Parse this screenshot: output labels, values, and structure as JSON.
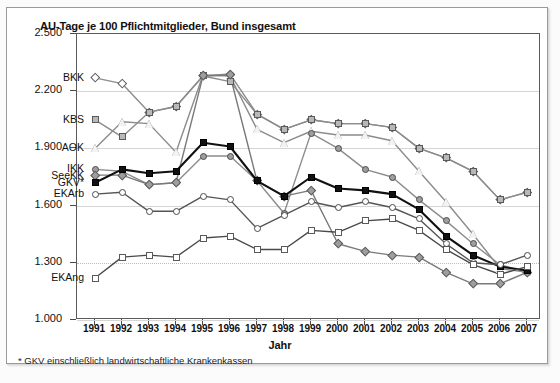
{
  "chart_data": {
    "type": "line",
    "title": "AU-Tage je 100 Pflichtmitglieder, Bund insgesamt",
    "xlabel": "Jahr",
    "ylabel": "",
    "footnote": "* GKV einschließlich landwirtschaftliche Krankenkassen",
    "grid": true,
    "legend_position": "inline-left",
    "ylim": [
      1000,
      2500
    ],
    "ytick_labels": [
      "2.500",
      "2.200",
      "1.900",
      "1.600",
      "1.300",
      "1.000"
    ],
    "ytick_values": [
      2500,
      2200,
      1900,
      1600,
      1300,
      1000
    ],
    "categories": [
      "1991",
      "1992",
      "1993",
      "1994",
      "1995",
      "1996",
      "1997",
      "1998",
      "1999",
      "2000",
      "2001",
      "2002",
      "2003",
      "2004",
      "2005",
      "2006",
      "2007"
    ],
    "series": [
      {
        "name": "BKK",
        "marker": "diamond-open",
        "color": "#8c8c8c",
        "fill": "#ffffff",
        "values": [
          2270,
          2240,
          2090,
          2120,
          2280,
          2290,
          2080,
          2000,
          2050,
          2030,
          2030,
          2010,
          1900,
          1850,
          1780,
          1630,
          1670
        ]
      },
      {
        "name": "KBS",
        "marker": "triangle-open",
        "color": "#8c8c8c",
        "fill": "#f2f2f2",
        "values": [
          1900,
          2040,
          2030,
          1880,
          2285,
          2280,
          2000,
          1930,
          1990,
          1970,
          1970,
          1940,
          1780,
          1620,
          1450,
          1270,
          1250
        ]
      },
      {
        "name": "AOK",
        "marker": "square-gray",
        "color": "#8c8c8c",
        "fill": "#b8b8b8",
        "values": [
          2050,
          1960,
          2090,
          2120,
          2280,
          2250,
          2080,
          2000,
          2050,
          2030,
          2030,
          2010,
          1900,
          1850,
          1780,
          1630,
          1670
        ]
      },
      {
        "name": "IKK",
        "marker": "circle-gray",
        "color": "#8c8c8c",
        "fill": "#9e9e9e",
        "values": [
          1790,
          1780,
          1710,
          1720,
          1860,
          1860,
          1730,
          1560,
          1980,
          1900,
          1790,
          1750,
          1630,
          1520,
          1400,
          1290,
          1250
        ]
      },
      {
        "name": "SeeKK",
        "marker": "diamond-gray",
        "color": "#7a7a7a",
        "fill": "#9e9e9e",
        "values": [
          1760,
          1760,
          1710,
          1720,
          2280,
          2285,
          1730,
          1650,
          1680,
          1400,
          1360,
          1340,
          1330,
          1250,
          1190,
          1190,
          1250
        ]
      },
      {
        "name": "GKV*",
        "marker": "square-black",
        "color": "#111111",
        "fill": "#111111",
        "values": [
          1720,
          1790,
          1770,
          1780,
          1930,
          1910,
          1730,
          1650,
          1750,
          1690,
          1680,
          1660,
          1580,
          1440,
          1340,
          1280,
          1260
        ]
      },
      {
        "name": "EKArb",
        "marker": "circle-open",
        "color": "#555555",
        "fill": "#ffffff",
        "values": [
          1660,
          1670,
          1570,
          1570,
          1650,
          1630,
          1480,
          1550,
          1620,
          1590,
          1620,
          1590,
          1530,
          1400,
          1300,
          1290,
          1340
        ]
      },
      {
        "name": "EKAng",
        "marker": "square-open",
        "color": "#4a4a4a",
        "fill": "#ffffff",
        "values": [
          1220,
          1330,
          1340,
          1330,
          1430,
          1440,
          1370,
          1370,
          1470,
          1460,
          1520,
          1530,
          1470,
          1370,
          1290,
          1240,
          1280
        ]
      }
    ],
    "series_label_positions": [
      {
        "name": "BKK",
        "value": 2270
      },
      {
        "name": "KBS",
        "value": 2050
      },
      {
        "name": "AOK",
        "value": 1900
      },
      {
        "name": "IKK",
        "value": 1790
      },
      {
        "name": "SeeKK",
        "value": 1755
      },
      {
        "name": "GKV*",
        "value": 1720
      },
      {
        "name": "EKArb",
        "value": 1660
      }
    ],
    "ekang_label": {
      "name": "EKAng",
      "value": 1220
    }
  }
}
